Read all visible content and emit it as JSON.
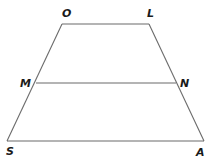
{
  "diagram": {
    "type": "trapezoid-with-midsegment",
    "colors": {
      "stroke": "#6b6b6b",
      "label": "#1a1a1a",
      "background": "#ffffff"
    },
    "vertices": {
      "O": {
        "label": "O",
        "x": 62,
        "y": 24
      },
      "L": {
        "label": "L",
        "x": 149,
        "y": 24
      },
      "M": {
        "label": "M",
        "x": 36,
        "y": 83
      },
      "N": {
        "label": "N",
        "x": 176,
        "y": 83
      },
      "S": {
        "label": "S",
        "x": 7,
        "y": 141
      },
      "A": {
        "label": "A",
        "x": 204,
        "y": 141
      }
    },
    "segments": [
      {
        "name": "OL",
        "from": "O",
        "to": "L"
      },
      {
        "name": "LA",
        "from": "L",
        "to": "A"
      },
      {
        "name": "AS",
        "from": "A",
        "to": "S"
      },
      {
        "name": "SO",
        "from": "S",
        "to": "O"
      },
      {
        "name": "MN",
        "from": "M",
        "to": "N"
      }
    ],
    "labels": {
      "O": "O",
      "L": "L",
      "M": "M",
      "N": "N",
      "S": "S",
      "A": "A"
    }
  }
}
